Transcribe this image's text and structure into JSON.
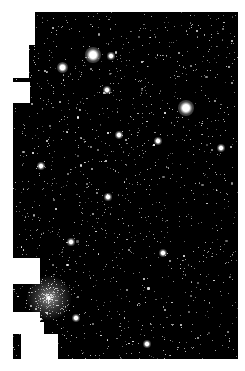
{
  "image": {
    "subject": "star field with globular cluster",
    "background_color": "#000000",
    "mask_color": "#ffffff",
    "frame": {
      "x": 13,
      "y": 12,
      "width": 225,
      "height": 347
    }
  },
  "masks": [
    {
      "x": 0,
      "y": 0,
      "w": 22,
      "h": 33
    },
    {
      "x": 0,
      "y": 33,
      "w": 16,
      "h": 33
    },
    {
      "x": 0,
      "y": 70,
      "w": 17,
      "h": 21
    },
    {
      "x": 0,
      "y": 246,
      "w": 27,
      "h": 26
    },
    {
      "x": 0,
      "y": 300,
      "w": 27,
      "h": 10
    },
    {
      "x": 0,
      "y": 310,
      "w": 31,
      "h": 12
    },
    {
      "x": 8,
      "y": 322,
      "w": 37,
      "h": 25
    }
  ],
  "bright_stars": [
    {
      "x": 80,
      "y": 43,
      "r": 3.5
    },
    {
      "x": 49,
      "y": 55,
      "r": 2.5
    },
    {
      "x": 173,
      "y": 96,
      "r": 3.5
    },
    {
      "x": 94,
      "y": 78,
      "r": 2
    },
    {
      "x": 106,
      "y": 123,
      "r": 2
    },
    {
      "x": 145,
      "y": 129,
      "r": 2
    },
    {
      "x": 208,
      "y": 136,
      "r": 2
    },
    {
      "x": 28,
      "y": 154,
      "r": 1.8
    },
    {
      "x": 150,
      "y": 241,
      "r": 1.8
    },
    {
      "x": 134,
      "y": 332,
      "r": 1.8
    },
    {
      "x": 95,
      "y": 185,
      "r": 1.6
    },
    {
      "x": 58,
      "y": 230,
      "r": 1.6
    },
    {
      "x": 98,
      "y": 44,
      "r": 1.6
    },
    {
      "x": 63,
      "y": 306,
      "r": 1.8
    }
  ],
  "cluster": {
    "x": 36,
    "y": 286,
    "r": 22
  },
  "star_seed": 1337,
  "star_count": 1400
}
